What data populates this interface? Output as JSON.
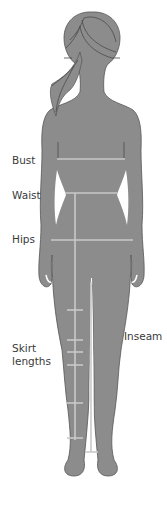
{
  "diagram": {
    "type": "body-measurement-guide",
    "colors": {
      "silhouette": "#8c8c8c",
      "outline": "#555555",
      "measure_line": "#c9c9c9",
      "hair_line": "#4a4a4a",
      "label_text": "#3a3a3a"
    },
    "labels": {
      "bust": "Bust",
      "waist": "Waist",
      "hips": "Hips",
      "skirt_lengths_line1": "Skirt",
      "skirt_lengths_line2": "lengths",
      "inseam": "Inseam"
    }
  }
}
